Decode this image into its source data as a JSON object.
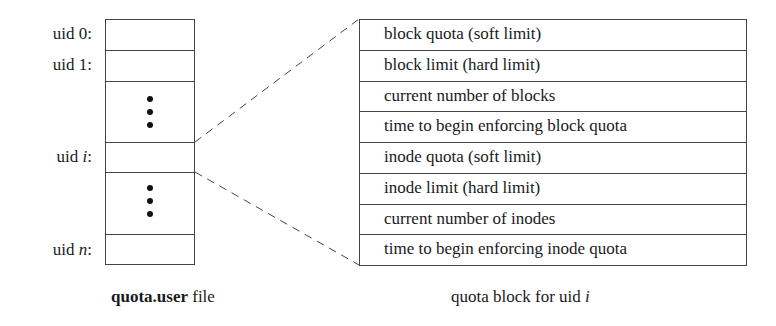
{
  "left_file": {
    "caption_bold": "quota.user",
    "caption_rest": " file",
    "labels": [
      {
        "prefix": "uid ",
        "var": "0",
        "suffix": ":",
        "italic": false
      },
      {
        "prefix": "uid ",
        "var": "1",
        "suffix": ":",
        "italic": false
      },
      {
        "prefix": "uid ",
        "var": "i",
        "suffix": ":",
        "italic": true
      },
      {
        "prefix": "uid ",
        "var": "n",
        "suffix": ":",
        "italic": true
      }
    ],
    "ellipsis_icon": "vertical-ellipsis"
  },
  "quota_block": {
    "caption_prefix": "quota block for uid ",
    "caption_var": "i",
    "fields": [
      "block quota (soft limit)",
      "block limit (hard limit)",
      "current number of blocks",
      "time to begin enforcing block quota",
      "inode quota (soft limit)",
      "inode limit (hard limit)",
      "current number of inodes",
      "time to begin enforcing inode quota"
    ]
  }
}
